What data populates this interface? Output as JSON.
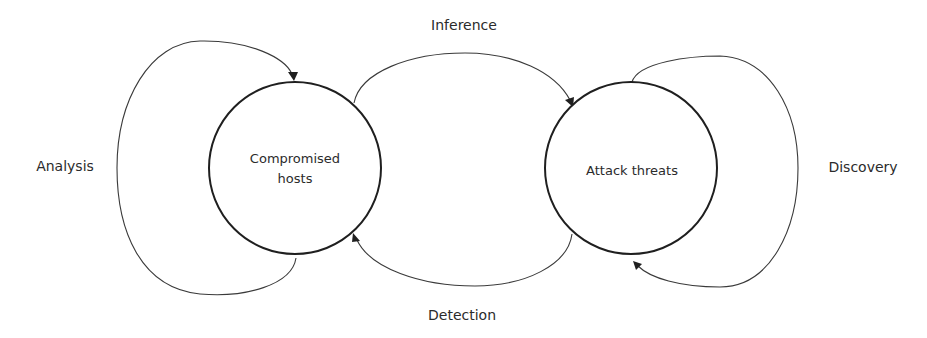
{
  "diagram": {
    "nodes": [
      {
        "id": "compromised-hosts",
        "label_lines": [
          "Compromised",
          "hosts"
        ],
        "cx": 295,
        "cy": 168,
        "r": 86
      },
      {
        "id": "attack-threats",
        "label_lines": [
          "Attack threats"
        ],
        "cx": 631,
        "cy": 168,
        "r": 86
      }
    ],
    "edges": [
      {
        "id": "analysis",
        "label": "Analysis",
        "from": "compromised-hosts",
        "to": "compromised-hosts",
        "type": "self-loop"
      },
      {
        "id": "inference",
        "label": "Inference",
        "from": "compromised-hosts",
        "to": "attack-threats",
        "type": "directed"
      },
      {
        "id": "detection",
        "label": "Detection",
        "from": "attack-threats",
        "to": "compromised-hosts",
        "type": "directed"
      },
      {
        "id": "discovery",
        "label": "Discovery",
        "from": "attack-threats",
        "to": "attack-threats",
        "type": "self-loop"
      }
    ],
    "labels": {
      "analysis": "Analysis",
      "inference": "Inference",
      "detection": "Detection",
      "discovery": "Discovery",
      "node_left_line1": "Compromised",
      "node_left_line2": "hosts",
      "node_right": "Attack threats"
    },
    "colors": {
      "stroke": "#1f1f1f",
      "text": "#2b2b2b",
      "background": "#ffffff"
    }
  }
}
